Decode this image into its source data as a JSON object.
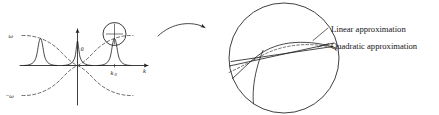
{
  "figure": {
    "panels": [
      {
        "id": "left-panel",
        "name": "spectrum-panel",
        "description": "Fourier amplitude spectrum with dispersion branches",
        "axes": {
          "x_label": "k",
          "y_label": "",
          "x_axis_name": "wavenumber-axis",
          "y_axis_name": "amplitude-axis"
        },
        "labels": {
          "omega_positive": "ω",
          "omega_negative": "−ω",
          "amplitude": "ũ",
          "k_zero": "k",
          "k_zero_subscript": "0",
          "k_axis": "k"
        },
        "peaks": [
          {
            "name": "negative-k-peak",
            "center_k": -1,
            "height": 1.0
          },
          {
            "name": "zero-k-peak",
            "center_k": 0,
            "height": 1.0
          },
          {
            "name": "positive-k-peak",
            "center_k": 1,
            "height": 1.0
          }
        ],
        "magnifier": {
          "name": "magnifier-circle",
          "target_peak": "positive-k-peak"
        }
      },
      {
        "id": "right-panel",
        "name": "magnified-dispersion-panel",
        "description": "Magnified view of dispersion curve near k0 with approximations",
        "annotations": [
          {
            "name": "linear-approximation-label",
            "text": "Linear approximation",
            "style": "solid-line"
          },
          {
            "name": "quadratic-approximation-label",
            "text": "Quadratic approximation",
            "style": "dashed-line"
          }
        ],
        "curves": [
          {
            "name": "exact-dispersion-curve",
            "style": "solid"
          },
          {
            "name": "linear-approximation-curve",
            "style": "solid"
          },
          {
            "name": "quadratic-approximation-curve",
            "style": "dashed"
          }
        ]
      }
    ],
    "connector": {
      "name": "magnification-arrow",
      "description": "Curved arrow from spectrum panel to magnified panel"
    },
    "colors": {
      "ink": "#1c1c1c",
      "dashed_ink": "#3a3a3a",
      "background": "#ffffff"
    }
  }
}
